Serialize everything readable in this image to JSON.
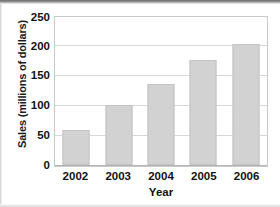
{
  "chart_data": {
    "type": "bar",
    "title": "",
    "subtitle": "",
    "xlabel": "Year",
    "ylabel": "Sales (millions of dollars)",
    "categories": [
      "2002",
      "2003",
      "2004",
      "2005",
      "2006"
    ],
    "values": [
      59,
      100,
      135,
      175,
      201
    ],
    "series": [
      {
        "name": "Sales",
        "values": [
          59,
          100,
          135,
          175,
          201
        ]
      }
    ],
    "ylim": [
      0,
      250
    ],
    "yticks": [
      0,
      50,
      100,
      150,
      200,
      250
    ],
    "ytick_labels": [
      "0",
      "50",
      "100",
      "150",
      "200",
      "250"
    ],
    "grid": true,
    "grid_axis": "y",
    "legend": false,
    "legend_position": "none",
    "bar_color": "#d2d2d2",
    "bar_border_color": "#c4c4c4",
    "gridline_color": "#d7d7d7",
    "frame_color": "#c9c9c9",
    "text_color": "#121212",
    "background_color": "#ffffff",
    "annotations": []
  }
}
